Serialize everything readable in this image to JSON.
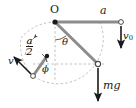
{
  "figure": {
    "name": "rigid-body-rod-kinematics-diagram",
    "background_color": "#ffffff",
    "ink_color": "#1a1a1a",
    "rod_color": "#8c8c8c",
    "dash_color": "#9b9b9b",
    "width": 136,
    "height": 108,
    "labels": {
      "pivot": "O",
      "upper_rod_length": "a",
      "upper_end_velocity": "v",
      "upper_end_velocity_sub": "0",
      "weight": "mg",
      "theta": "θ",
      "phi": "ϕ",
      "lower_velocity": "v",
      "half_length_num": "a",
      "half_length_den": "2"
    },
    "geometry": {
      "pivot_point": [
        55,
        22
      ],
      "upper_right_end": [
        121,
        22
      ],
      "lower_right_mass": [
        98,
        64
      ],
      "mid_left_node": [
        47,
        56
      ],
      "lower_left_end": [
        33,
        76
      ],
      "circle_radius": 45,
      "theta_value_deg": 33,
      "phi_value_deg": 55
    },
    "arrows": {
      "v0": {
        "from": [
          121,
          26
        ],
        "to": [
          121,
          48
        ],
        "direction": "down"
      },
      "mg": {
        "from": [
          98,
          68
        ],
        "to": [
          98,
          100
        ],
        "direction": "down"
      },
      "v": {
        "from": [
          31,
          74
        ],
        "to": [
          14,
          58
        ],
        "direction": "up-left"
      },
      "rotation_arc": {
        "direction": "counter-clockwise",
        "style": "dashed"
      }
    }
  }
}
